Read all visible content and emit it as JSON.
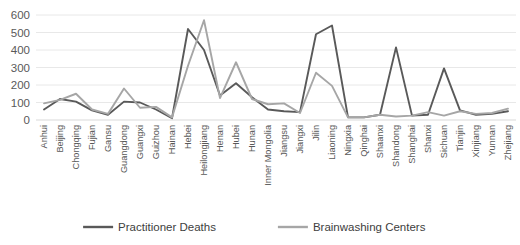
{
  "chart_data": {
    "type": "line",
    "title": "",
    "xlabel": "",
    "ylabel": "",
    "ylim": [
      0,
      600
    ],
    "ytick_values": [
      0,
      100,
      200,
      300,
      400,
      500,
      600
    ],
    "ytick_labels": [
      "0",
      "100",
      "200",
      "300",
      "400",
      "500",
      "600"
    ],
    "grid": true,
    "legend_position": "bottom",
    "categories": [
      "Anhui",
      "Beijing",
      "Chongqing",
      "Fujian",
      "Gansu",
      "Guangdong",
      "Guangxi",
      "Guizhou",
      "Hainan",
      "Hebei",
      "Heilongjiang",
      "Henan",
      "Hubei",
      "Hunan",
      "Inner Mongolia",
      "Jiangsu",
      "Jiangxi",
      "Jilin",
      "Liaoning",
      "Ningxia",
      "Qinghai",
      "Shaanxi",
      "Shandong",
      "Shanghai",
      "Shanxi",
      "Sichuan",
      "Tianjin",
      "Xinjiang",
      "Yunnan",
      "Zhejiang"
    ],
    "series": [
      {
        "name": "Practitioner Deaths",
        "color": "#595959",
        "values": [
          60,
          120,
          105,
          55,
          30,
          105,
          100,
          60,
          10,
          520,
          400,
          140,
          210,
          130,
          60,
          50,
          45,
          490,
          540,
          15,
          15,
          30,
          415,
          25,
          30,
          295,
          55,
          30,
          35,
          50
        ]
      },
      {
        "name": "Brainwashing Centers",
        "color": "#a6a6a6",
        "values": [
          95,
          115,
          150,
          60,
          35,
          180,
          70,
          75,
          15,
          310,
          570,
          125,
          330,
          120,
          90,
          95,
          40,
          270,
          195,
          15,
          15,
          30,
          20,
          25,
          45,
          25,
          50,
          35,
          40,
          65
        ]
      }
    ]
  },
  "legend": {
    "items": [
      {
        "label": "Practitioner Deaths",
        "color": "#595959"
      },
      {
        "label": "Brainwashing Centers",
        "color": "#a6a6a6"
      }
    ]
  }
}
